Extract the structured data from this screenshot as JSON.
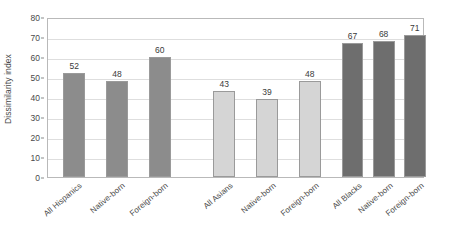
{
  "chart_data": {
    "type": "bar",
    "title": "",
    "xlabel": "",
    "ylabel": "Dissimilarity index",
    "ylim": [
      0,
      80
    ],
    "ytick_step": 10,
    "yticks": [
      0,
      10,
      20,
      30,
      40,
      50,
      60,
      70,
      80
    ],
    "grid": true,
    "legend": "none",
    "categories": [
      "All Hispanics",
      "Native-born",
      "Foreign-born",
      "All Asians",
      "Native-born",
      "Foreign-born",
      "All Blacks",
      "Native-born",
      "Foreign-born"
    ],
    "values": [
      52,
      48,
      60,
      43,
      39,
      48,
      67,
      68,
      71
    ],
    "groups": [
      {
        "name": "Hispanics",
        "color": "#8c8c8c",
        "indices": [
          0,
          1,
          2
        ]
      },
      {
        "name": "Asians",
        "color": "#d5d5d5",
        "indices": [
          3,
          4,
          5
        ]
      },
      {
        "name": "Blacks",
        "color": "#6e6e6e",
        "indices": [
          6,
          7,
          8
        ]
      }
    ],
    "bar_colors": [
      "#8c8c8c",
      "#8c8c8c",
      "#8c8c8c",
      "#d5d5d5",
      "#d5d5d5",
      "#d5d5d5",
      "#6e6e6e",
      "#6e6e6e",
      "#6e6e6e"
    ],
    "bar_centers_pct": [
      7.0,
      18.4,
      29.8,
      47.0,
      58.4,
      69.8,
      81.2,
      89.5,
      97.8
    ],
    "bar_width_pct": 5.8,
    "axis_color": "#b9b9b9",
    "grid_color": "#dedede",
    "text_color": "#4a4a4a"
  }
}
